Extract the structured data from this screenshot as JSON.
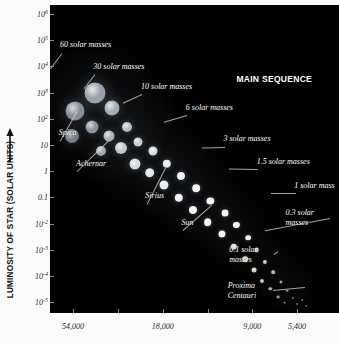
{
  "axes": {
    "y_title": "LUMINOSITY OF STAR (SOLAR UNITS)",
    "y_arrow_icon": "up-arrow-icon",
    "y_ticks": [
      {
        "label": "10",
        "exp": "6",
        "value": 1000000.0
      },
      {
        "label": "10",
        "exp": "5",
        "value": 100000.0
      },
      {
        "label": "10",
        "exp": "4",
        "value": 10000.0
      },
      {
        "label": "10",
        "exp": "3",
        "value": 1000
      },
      {
        "label": "10",
        "exp": "2",
        "value": 100
      },
      {
        "label": "10",
        "exp": "",
        "value": 10
      },
      {
        "label": "1",
        "exp": "",
        "value": 1
      },
      {
        "label": "0.1",
        "exp": "",
        "value": 0.1
      },
      {
        "label": "10",
        "exp": "-2",
        "value": 0.01
      },
      {
        "label": "10",
        "exp": "-3",
        "value": 0.001
      },
      {
        "label": "10",
        "exp": "-4",
        "value": 0.0001
      },
      {
        "label": "10",
        "exp": "-5",
        "value": 1e-05
      }
    ],
    "x_ticks": [
      {
        "label": "54,000",
        "pos": 0.08
      },
      {
        "label": "18,000",
        "pos": 0.39
      },
      {
        "label": "9,000",
        "pos": 0.7
      },
      {
        "label": "5,400",
        "pos": 0.855
      }
    ]
  },
  "chart_data": {
    "type": "scatter",
    "title": "MAIN SEQUENCE",
    "xlabel": "",
    "ylabel": "LUMINOSITY OF STAR (SOLAR UNITS)",
    "x_axis_kind": "surface temperature (Kelvin), decreasing left to right",
    "xticklabels": [
      "54,000",
      "18,000",
      "9,000",
      "5,400"
    ],
    "yticklabels": [
      "10^6",
      "10^5",
      "10^4",
      "10^3",
      "10^2",
      "10",
      "1",
      "0.1",
      "10^-2",
      "10^-3",
      "10^-4",
      "10^-5"
    ],
    "ylim": [
      1e-05,
      1000000
    ],
    "grid": false,
    "legend": "none",
    "annotations": [
      {
        "text": "60 solar masses",
        "mass": 60,
        "luminosity": 800000
      },
      {
        "text": "30 solar masses",
        "mass": 30,
        "luminosity": 100000
      },
      {
        "text": "10 solar masses",
        "mass": 10,
        "luminosity": 5000
      },
      {
        "text": "6 solar masses",
        "mass": 6,
        "luminosity": 1000
      },
      {
        "text": "3 solar masses",
        "mass": 3,
        "luminosity": 100
      },
      {
        "text": "1.5 solar masses",
        "mass": 1.5,
        "luminosity": 10
      },
      {
        "text": "1 solar mass",
        "mass": 1,
        "luminosity": 1
      },
      {
        "text": "0.3 solar\nmasses",
        "mass": 0.3,
        "luminosity": 0.01
      },
      {
        "text": "0.1 solar\nmasses",
        "mass": 0.1,
        "luminosity": 0.001
      },
      {
        "text": "Spica",
        "mass": 11,
        "luminosity": 2000
      },
      {
        "text": "Achernar",
        "mass": 7,
        "luminosity": 300
      },
      {
        "text": "Sirius",
        "mass": 2.1,
        "luminosity": 25
      },
      {
        "text": "Sun",
        "mass": 1,
        "luminosity": 1
      },
      {
        "text": "Proxima\nCentauri",
        "mass": 0.12,
        "luminosity": 5e-05
      }
    ],
    "series": [
      {
        "name": "main sequence stars",
        "points": [
          {
            "x": 0.085,
            "y": 0.345,
            "r": 9.5,
            "c": "#9aa6b4",
            "a": 0.85
          },
          {
            "x": 0.155,
            "y": 0.285,
            "r": 10.5,
            "c": "#a6b2c0",
            "a": 0.9
          },
          {
            "x": 0.075,
            "y": 0.425,
            "r": 7.0,
            "c": "#93a0ae",
            "a": 0.8
          },
          {
            "x": 0.145,
            "y": 0.395,
            "r": 6.5,
            "c": "#9fabb9",
            "a": 0.85
          },
          {
            "x": 0.215,
            "y": 0.335,
            "r": 7.5,
            "c": "#b3bfcc",
            "a": 0.9
          },
          {
            "x": 0.205,
            "y": 0.425,
            "r": 5.5,
            "c": "#b9c4d0",
            "a": 0.9
          },
          {
            "x": 0.265,
            "y": 0.395,
            "r": 5.0,
            "c": "#c3ced8",
            "a": 0.92
          },
          {
            "x": 0.175,
            "y": 0.475,
            "r": 5.0,
            "c": "#b0bcc8",
            "a": 0.88
          },
          {
            "x": 0.245,
            "y": 0.465,
            "r": 6.0,
            "c": "#ccd6e0",
            "a": 0.93
          },
          {
            "x": 0.305,
            "y": 0.445,
            "r": 4.5,
            "c": "#d2dae2",
            "a": 0.93
          },
          {
            "x": 0.295,
            "y": 0.515,
            "r": 5.5,
            "c": "#dde4ea",
            "a": 0.95
          },
          {
            "x": 0.355,
            "y": 0.475,
            "r": 4.5,
            "c": "#e4eaef",
            "a": 0.95
          },
          {
            "x": 0.345,
            "y": 0.545,
            "r": 4.8,
            "c": "#e8edf1",
            "a": 0.96
          },
          {
            "x": 0.405,
            "y": 0.515,
            "r": 4.2,
            "c": "#eef2f5",
            "a": 0.96
          },
          {
            "x": 0.395,
            "y": 0.585,
            "r": 4.5,
            "c": "#f0f4f7",
            "a": 0.96
          },
          {
            "x": 0.455,
            "y": 0.555,
            "r": 4.0,
            "c": "#f4f7f9",
            "a": 0.97
          },
          {
            "x": 0.445,
            "y": 0.625,
            "r": 4.2,
            "c": "#f6f8fa",
            "a": 0.97
          },
          {
            "x": 0.505,
            "y": 0.595,
            "r": 3.8,
            "c": "#f8fafb",
            "a": 0.97
          },
          {
            "x": 0.495,
            "y": 0.665,
            "r": 4.0,
            "c": "#fafbfc",
            "a": 0.97
          },
          {
            "x": 0.555,
            "y": 0.635,
            "r": 3.6,
            "c": "#fbfcfd",
            "a": 0.97
          },
          {
            "x": 0.545,
            "y": 0.705,
            "r": 3.8,
            "c": "#fdfdfe",
            "a": 0.97
          },
          {
            "x": 0.605,
            "y": 0.675,
            "r": 3.4,
            "c": "#fefefe",
            "a": 0.97
          },
          {
            "x": 0.595,
            "y": 0.745,
            "r": 3.5,
            "c": "#ffffff",
            "a": 0.97
          },
          {
            "x": 0.645,
            "y": 0.715,
            "r": 3.1,
            "c": "#ffffff",
            "a": 0.96
          },
          {
            "x": 0.635,
            "y": 0.785,
            "r": 3.2,
            "c": "#ffffff",
            "a": 0.95
          },
          {
            "x": 0.685,
            "y": 0.755,
            "r": 2.8,
            "c": "#fff8f0",
            "a": 0.94
          },
          {
            "x": 0.675,
            "y": 0.825,
            "r": 2.8,
            "c": "#fff4e8",
            "a": 0.92
          },
          {
            "x": 0.715,
            "y": 0.795,
            "r": 2.4,
            "c": "#ffeedd",
            "a": 0.9
          },
          {
            "x": 0.705,
            "y": 0.862,
            "r": 2.4,
            "c": "#ffe9d4",
            "a": 0.88
          },
          {
            "x": 0.745,
            "y": 0.835,
            "r": 2.1,
            "c": "#ffe2c8",
            "a": 0.85
          },
          {
            "x": 0.735,
            "y": 0.895,
            "r": 2.0,
            "c": "#ffddbe",
            "a": 0.82
          },
          {
            "x": 0.772,
            "y": 0.868,
            "r": 1.8,
            "c": "#ffd6b2",
            "a": 0.78
          },
          {
            "x": 0.762,
            "y": 0.922,
            "r": 1.7,
            "c": "#ffd0a8",
            "a": 0.74
          },
          {
            "x": 0.798,
            "y": 0.9,
            "r": 1.5,
            "c": "#ffcb9e",
            "a": 0.7
          },
          {
            "x": 0.788,
            "y": 0.948,
            "r": 1.4,
            "c": "#ffc695",
            "a": 0.66
          },
          {
            "x": 0.82,
            "y": 0.928,
            "r": 1.3,
            "c": "#ffc28e",
            "a": 0.62
          },
          {
            "x": 0.812,
            "y": 0.966,
            "r": 1.2,
            "c": "#ffbe88",
            "a": 0.58
          },
          {
            "x": 0.84,
            "y": 0.95,
            "r": 1.1,
            "c": "#ffba82",
            "a": 0.55
          },
          {
            "x": 0.856,
            "y": 0.972,
            "r": 1.0,
            "c": "#ffb67c",
            "a": 0.5
          },
          {
            "x": 0.872,
            "y": 0.958,
            "r": 0.9,
            "c": "#ffb277",
            "a": 0.46
          },
          {
            "x": 0.886,
            "y": 0.978,
            "r": 0.9,
            "c": "#ffae72",
            "a": 0.42
          }
        ]
      }
    ]
  },
  "labels": {
    "main_sequence": "MAIN SEQUENCE",
    "m60": "60 solar masses",
    "m30": "30 solar masses",
    "m10": "10 solar masses",
    "m6": "6 solar masses",
    "m3": "3 solar masses",
    "m15": "1.5 solar masses",
    "m1": "1 solar mass",
    "m03_line1": "0.3 solar",
    "m03_line2": "masses",
    "m01_line1": "0.1 solar",
    "m01_line2": "masses",
    "spica": "Spica",
    "achernar": "Achernar",
    "sirius": "Sirius",
    "sun": "Sun",
    "proxima_line1": "Proxima",
    "proxima_line2": "Centauri"
  }
}
